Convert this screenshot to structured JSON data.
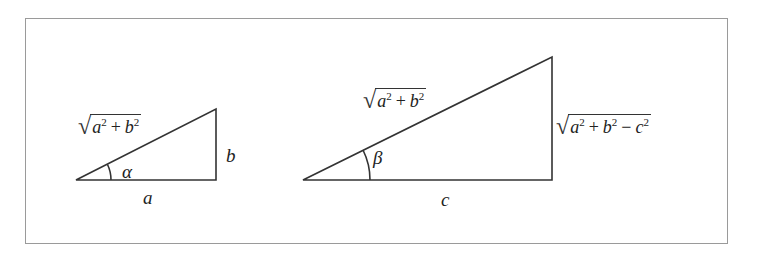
{
  "colors": {
    "stroke": "#333333",
    "frame": "#9a9a9a",
    "background": "#ffffff"
  },
  "triangle_small": {
    "vertices": {
      "left": [
        76,
        180
      ],
      "right": [
        216,
        180
      ],
      "top": [
        216,
        109
      ]
    },
    "labels": {
      "base": "a",
      "height": "b",
      "angle": "α",
      "hypotenuse": {
        "radical": "√",
        "term1": "a",
        "exp1": "2",
        "op1": "+",
        "term2": "b",
        "exp2": "2"
      }
    }
  },
  "triangle_large": {
    "vertices": {
      "left": [
        303,
        180
      ],
      "right": [
        552,
        180
      ],
      "top": [
        552,
        57
      ]
    },
    "labels": {
      "base": "c",
      "angle": "β",
      "hypotenuse": {
        "radical": "√",
        "term1": "a",
        "exp1": "2",
        "op1": "+",
        "term2": "b",
        "exp2": "2"
      },
      "height": {
        "radical": "√",
        "term1": "a",
        "exp1": "2",
        "op1": "+",
        "term2": "b",
        "exp2": "2",
        "op2": "−",
        "term3": "c",
        "exp3": "2"
      }
    }
  }
}
